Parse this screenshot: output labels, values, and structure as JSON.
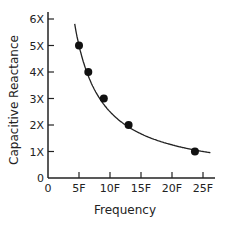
{
  "chart_data": {
    "type": "line",
    "title": "",
    "xlabel": "Frequency",
    "ylabel": "Capacitive Reactance",
    "x_ticks": [
      "0",
      "5F",
      "10F",
      "15F",
      "20F",
      "25F"
    ],
    "y_ticks": [
      "0",
      "1X",
      "2X",
      "3X",
      "4X",
      "5X",
      "6X"
    ],
    "xlim": [
      0,
      25
    ],
    "ylim": [
      0,
      6
    ],
    "grid": false,
    "legend": null,
    "series": [
      {
        "name": "Capacitive Reactance vs Frequency",
        "style": "curve with markers",
        "points": [
          {
            "x": 5,
            "y": 5
          },
          {
            "x": 6.5,
            "y": 4
          },
          {
            "x": 9,
            "y": 3
          },
          {
            "x": 13,
            "y": 2
          },
          {
            "x": 23.7,
            "y": 1
          }
        ]
      }
    ],
    "curve_relation": "inverse (y ∝ 1/x)"
  }
}
